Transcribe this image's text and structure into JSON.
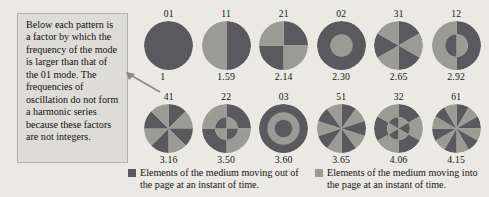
{
  "callout": {
    "text": "Below each pattern is a factor by which the frequency of the mode is larger than that of the 01 mode. The frequencies of oscillation do not form a harmonic series because these factors are not integers."
  },
  "colors": {
    "out_of_page": "#5a5a5e",
    "into_page": "#9b9b96",
    "background": "#ebe9e4",
    "box_fill": "#dedcd7",
    "box_border": "#b4b1aa",
    "text": "#141414"
  },
  "legend": [
    {
      "swatch_name": "legend-swatch-out-of-page",
      "color": "#5a5a5e",
      "text": "Elements of the medium moving out of the page at an instant of time."
    },
    {
      "swatch_name": "legend-swatch-into-page",
      "color": "#9b9b96",
      "text": "Elements of the medium moving into the page at an instant of time."
    }
  ],
  "chart_data": {
    "type": "diagram",
    "xlabel": "",
    "ylabel": "",
    "legend_position": "bottom",
    "categories": [
      "01",
      "11",
      "21",
      "02",
      "31",
      "12",
      "41",
      "22",
      "03",
      "51",
      "32",
      "61"
    ],
    "values": [
      1,
      1.59,
      2.14,
      2.3,
      2.65,
      2.92,
      3.16,
      3.5,
      3.6,
      3.65,
      4.06,
      4.15
    ],
    "modes": [
      {
        "label": "01",
        "factor": "1",
        "value": 1.0,
        "pattern": "sectors",
        "sectors": 1,
        "rings": 1,
        "start_dark": true
      },
      {
        "label": "11",
        "factor": "1.59",
        "value": 1.59,
        "pattern": "sectors",
        "sectors": 2,
        "rings": 1,
        "start_dark": true
      },
      {
        "label": "21",
        "factor": "2.14",
        "value": 2.14,
        "pattern": "sectors",
        "sectors": 4,
        "rings": 1,
        "start_dark": true
      },
      {
        "label": "02",
        "factor": "2.30",
        "value": 2.3,
        "pattern": "rings",
        "sectors": 1,
        "rings": 2,
        "start_dark": true
      },
      {
        "label": "31",
        "factor": "2.65",
        "value": 2.65,
        "pattern": "sectors",
        "sectors": 6,
        "rings": 1,
        "start_dark": true
      },
      {
        "label": "12",
        "factor": "2.92",
        "value": 2.92,
        "pattern": "sectors-rings",
        "sectors": 2,
        "rings": 2,
        "start_dark": true
      },
      {
        "label": "41",
        "factor": "3.16",
        "value": 3.16,
        "pattern": "sectors",
        "sectors": 8,
        "rings": 1,
        "start_dark": true
      },
      {
        "label": "22",
        "factor": "3.50",
        "value": 3.5,
        "pattern": "sectors-rings",
        "sectors": 4,
        "rings": 2,
        "start_dark": true
      },
      {
        "label": "03",
        "factor": "3.60",
        "value": 3.6,
        "pattern": "rings",
        "sectors": 1,
        "rings": 3,
        "start_dark": true
      },
      {
        "label": "51",
        "factor": "3.65",
        "value": 3.65,
        "pattern": "sectors",
        "sectors": 10,
        "rings": 1,
        "start_dark": true
      },
      {
        "label": "32",
        "factor": "4.06",
        "value": 4.06,
        "pattern": "sectors-rings",
        "sectors": 6,
        "rings": 2,
        "start_dark": true
      },
      {
        "label": "61",
        "factor": "4.15",
        "value": 4.15,
        "pattern": "sectors",
        "sectors": 12,
        "rings": 1,
        "start_dark": true
      }
    ]
  }
}
